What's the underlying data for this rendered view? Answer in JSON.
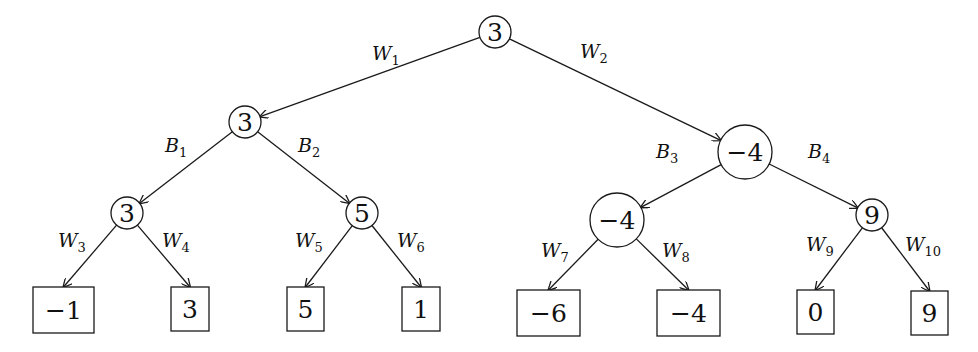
{
  "diagram": {
    "type": "game-tree",
    "nodes": [
      {
        "id": "root",
        "value": "3",
        "shape": "circle",
        "cx": 495,
        "cy": 32,
        "r": 16
      },
      {
        "id": "n1",
        "value": "3",
        "shape": "circle",
        "cx": 245,
        "cy": 122,
        "r": 16
      },
      {
        "id": "n2",
        "value": "−4",
        "shape": "circle",
        "cx": 745,
        "cy": 152,
        "r": 27
      },
      {
        "id": "n3",
        "value": "3",
        "shape": "circle",
        "cx": 127,
        "cy": 213,
        "r": 16
      },
      {
        "id": "n4",
        "value": "5",
        "shape": "circle",
        "cx": 362,
        "cy": 213,
        "r": 16
      },
      {
        "id": "n5",
        "value": "−4",
        "shape": "circle",
        "cx": 617,
        "cy": 220,
        "r": 27
      },
      {
        "id": "n6",
        "value": "9",
        "shape": "circle",
        "cx": 872,
        "cy": 215,
        "r": 16
      }
    ],
    "leaves": [
      {
        "id": "l1",
        "value": "−1",
        "x": 33,
        "y": 287,
        "w": 61,
        "h": 46
      },
      {
        "id": "l2",
        "value": "3",
        "x": 171,
        "y": 287,
        "w": 38,
        "h": 44
      },
      {
        "id": "l3",
        "value": "5",
        "x": 287,
        "y": 287,
        "w": 37,
        "h": 44
      },
      {
        "id": "l4",
        "value": "1",
        "x": 402,
        "y": 287,
        "w": 38,
        "h": 44
      },
      {
        "id": "l5",
        "value": "−6",
        "x": 517,
        "y": 290,
        "w": 63,
        "h": 46
      },
      {
        "id": "l6",
        "value": "−4",
        "x": 657,
        "y": 290,
        "w": 63,
        "h": 46
      },
      {
        "id": "l7",
        "value": "0",
        "x": 797,
        "y": 290,
        "w": 37,
        "h": 44
      },
      {
        "id": "l8",
        "value": "9",
        "x": 911,
        "y": 291,
        "w": 37,
        "h": 44
      }
    ],
    "edges": [
      {
        "from": "root",
        "to": "n1",
        "label": "W",
        "sub": "1",
        "lx": 372,
        "ly": 60
      },
      {
        "from": "root",
        "to": "n2",
        "label": "W",
        "sub": "2",
        "lx": 580,
        "ly": 58
      },
      {
        "from": "n1",
        "to": "n3",
        "label": "B",
        "sub": "1",
        "lx": 165,
        "ly": 152
      },
      {
        "from": "n1",
        "to": "n4",
        "label": "B",
        "sub": "2",
        "lx": 298,
        "ly": 152
      },
      {
        "from": "n2",
        "to": "n5",
        "label": "B",
        "sub": "3",
        "lx": 656,
        "ly": 158
      },
      {
        "from": "n2",
        "to": "n6",
        "label": "B",
        "sub": "4",
        "lx": 808,
        "ly": 158
      },
      {
        "from": "n3",
        "to": "l1",
        "label": "W",
        "sub": "3",
        "lx": 58,
        "ly": 247
      },
      {
        "from": "n3",
        "to": "l2",
        "label": "W",
        "sub": "4",
        "lx": 162,
        "ly": 247
      },
      {
        "from": "n4",
        "to": "l3",
        "label": "W",
        "sub": "5",
        "lx": 295,
        "ly": 247
      },
      {
        "from": "n4",
        "to": "l4",
        "label": "W",
        "sub": "6",
        "lx": 397,
        "ly": 247
      },
      {
        "from": "n5",
        "to": "l5",
        "label": "W",
        "sub": "7",
        "lx": 541,
        "ly": 257
      },
      {
        "from": "n5",
        "to": "l6",
        "label": "W",
        "sub": "8",
        "lx": 662,
        "ly": 257
      },
      {
        "from": "n6",
        "to": "l7",
        "label": "W",
        "sub": "9",
        "lx": 806,
        "ly": 251
      },
      {
        "from": "n6",
        "to": "l8",
        "label": "W",
        "sub": "10",
        "lx": 905,
        "ly": 251
      }
    ],
    "colors": {
      "stroke": "#1a1a1a",
      "background": "#ffffff",
      "text": "#111111"
    }
  }
}
